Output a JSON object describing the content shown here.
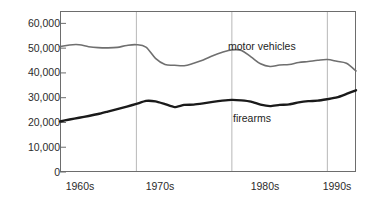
{
  "chart_data": {
    "type": "line",
    "title": "",
    "subtitle": "",
    "xlabel": "",
    "ylabel": "",
    "xlim": [
      1962,
      1993
    ],
    "ylim": [
      0,
      65000
    ],
    "grid": "vertical-decade-lines",
    "legend": "inline-annotations",
    "y_ticks": [
      0,
      10000,
      20000,
      30000,
      40000,
      50000,
      60000
    ],
    "y_tick_labels": [
      "0",
      "10,000",
      "20,000",
      "30,000",
      "40,000",
      "50,000",
      "60,000"
    ],
    "x_tick_labels": [
      "1960s",
      "1970s",
      "1980s",
      "1990s"
    ],
    "x_decade_boundaries": [
      1970,
      1980,
      1990
    ],
    "series": [
      {
        "name": "motor vehicles",
        "color": "#6f6f6f",
        "width": 1.6,
        "x": [
          1962,
          1963,
          1964,
          1965,
          1966,
          1967,
          1968,
          1969,
          1970,
          1971,
          1972,
          1973,
          1974,
          1975,
          1976,
          1977,
          1978,
          1979,
          1980,
          1981,
          1982,
          1983,
          1984,
          1985,
          1986,
          1987,
          1988,
          1989,
          1990,
          1991,
          1992,
          1993
        ],
        "values": [
          50600,
          51300,
          51400,
          50600,
          50200,
          50100,
          50300,
          51100,
          51400,
          50400,
          45900,
          43400,
          43100,
          42900,
          43900,
          45200,
          46900,
          48300,
          49300,
          49100,
          46500,
          43700,
          42600,
          43200,
          43400,
          44200,
          44600,
          45100,
          45400,
          44700,
          43900,
          40800
        ]
      },
      {
        "name": "firearms",
        "color": "#1a1a1a",
        "width": 2.4,
        "x": [
          1962,
          1963,
          1964,
          1965,
          1966,
          1967,
          1968,
          1969,
          1970,
          1971,
          1972,
          1973,
          1974,
          1975,
          1976,
          1977,
          1978,
          1979,
          1980,
          1981,
          1982,
          1983,
          1984,
          1985,
          1986,
          1987,
          1988,
          1989,
          1990,
          1991,
          1992,
          1993
        ],
        "values": [
          20400,
          21200,
          21900,
          22600,
          23400,
          24400,
          25400,
          26400,
          27500,
          28700,
          28500,
          27400,
          26200,
          27100,
          27200,
          27700,
          28300,
          28800,
          29100,
          28900,
          28400,
          27200,
          26600,
          27100,
          27300,
          28100,
          28600,
          28800,
          29400,
          30100,
          31500,
          33000
        ]
      }
    ],
    "annotations": [
      {
        "text": "motor vehicles",
        "x": 1982,
        "y": 52500
      },
      {
        "text": "firearms",
        "x": 1983,
        "y": 23000
      }
    ]
  },
  "axes": {
    "plot_left": 60,
    "plot_right": 356,
    "plot_top": 11,
    "plot_bottom": 172,
    "axis_color": "#6d6d6d",
    "grid_color": "#b8b8b8",
    "tick_color": "#6d6d6d",
    "background": "#ffffff"
  }
}
